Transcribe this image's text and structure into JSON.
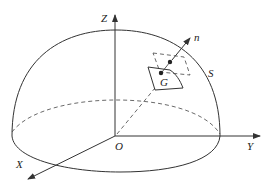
{
  "diagram": {
    "type": "hemisphere-surface-element",
    "labels": {
      "z_axis": "Z",
      "y_axis": "Y",
      "x_axis": "X",
      "origin": "O",
      "normal": "n",
      "surface": "S",
      "centroid": "G"
    },
    "colors": {
      "line": "#333333",
      "background": "#ffffff"
    }
  }
}
